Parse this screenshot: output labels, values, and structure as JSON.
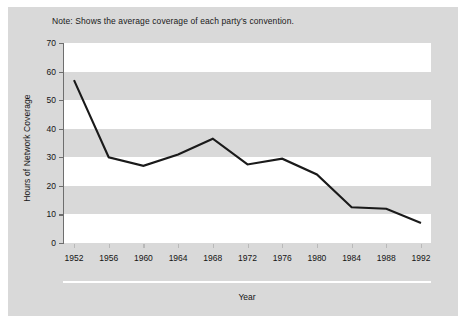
{
  "note": "Note: Shows the average coverage of each party's convention.",
  "axis": {
    "ylabel": "Hours of Network Coverage",
    "xlabel": "Year",
    "yticks": [
      "0",
      "10",
      "20",
      "30",
      "40",
      "50",
      "60",
      "70"
    ],
    "xticks": [
      "1952",
      "1956",
      "1960",
      "1964",
      "1968",
      "1972",
      "1976",
      "1980",
      "1984",
      "1988",
      "1992"
    ]
  },
  "colors": {
    "panel_background": "#d9d9d9",
    "band_white": "#ffffff",
    "line": "#1a1a1a",
    "axis": "#6e6e6e",
    "text": "#141414"
  },
  "chart_data": {
    "type": "line",
    "title": "",
    "subtitle": "Note: Shows the average coverage of each party's convention.",
    "xlabel": "Year",
    "ylabel": "Hours of Network Coverage",
    "xlim": [
      1952,
      1992
    ],
    "ylim": [
      0,
      70
    ],
    "ytick_values": [
      0,
      10,
      20,
      30,
      40,
      50,
      60,
      70
    ],
    "xtick_values": [
      1952,
      1956,
      1960,
      1964,
      1968,
      1972,
      1976,
      1980,
      1984,
      1988,
      1992
    ],
    "grid": false,
    "banded_background": true,
    "legend": null,
    "x": [
      1952,
      1956,
      1960,
      1964,
      1968,
      1972,
      1976,
      1980,
      1984,
      1988,
      1992
    ],
    "values": [
      57,
      30,
      27,
      31,
      36.5,
      27.5,
      29.5,
      24,
      12.5,
      12,
      7
    ],
    "series": [
      {
        "name": "Hours of Network Coverage",
        "values": [
          57,
          30,
          27,
          31,
          36.5,
          27.5,
          29.5,
          24,
          12.5,
          12,
          7
        ]
      }
    ]
  }
}
